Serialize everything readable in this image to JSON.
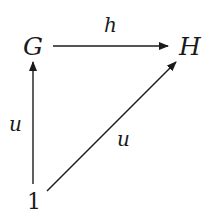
{
  "diagram": {
    "type": "commutative-diagram",
    "nodes": [
      {
        "id": "G",
        "label": "G"
      },
      {
        "id": "H",
        "label": "H"
      },
      {
        "id": "one",
        "label": "1"
      }
    ],
    "edges": [
      {
        "from": "G",
        "to": "H",
        "label": "h"
      },
      {
        "from": "one",
        "to": "G",
        "label": "u"
      },
      {
        "from": "one",
        "to": "H",
        "label": "u"
      }
    ],
    "colors": {
      "ink": "#1a1a1a",
      "background": "#ffffff"
    }
  }
}
